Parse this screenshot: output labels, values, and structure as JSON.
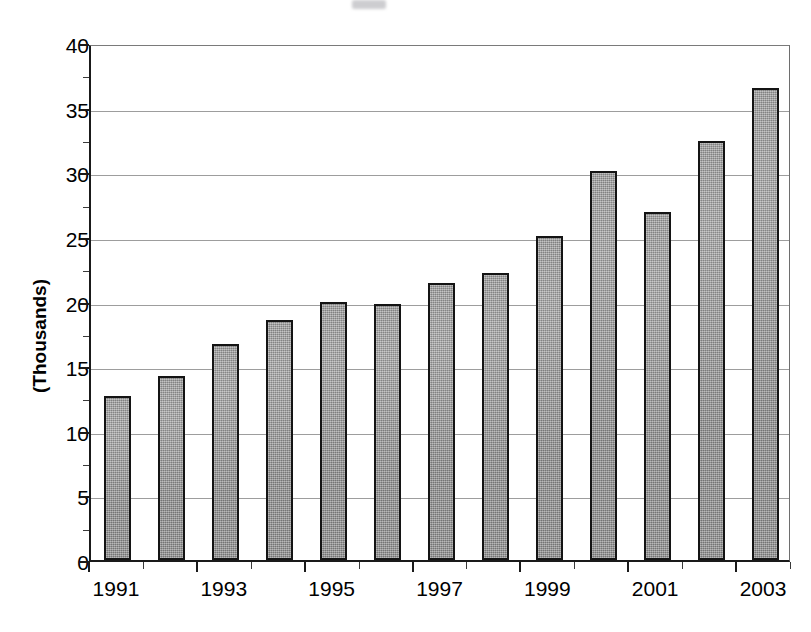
{
  "chart_data": {
    "type": "bar",
    "title": "",
    "xlabel": "",
    "ylabel": "(Thousands)",
    "categories": [
      "1991",
      "1992",
      "1993",
      "1994",
      "1995",
      "1996",
      "1997",
      "1998",
      "1999",
      "2000",
      "2001",
      "2002",
      "2003"
    ],
    "values": [
      12.7,
      14.2,
      16.7,
      18.6,
      20.0,
      19.8,
      21.4,
      22.2,
      25.1,
      30.1,
      26.9,
      32.4,
      36.5
    ],
    "ylim": [
      0,
      40
    ],
    "ytick_step": 5,
    "yticks": [
      0,
      5,
      10,
      15,
      20,
      25,
      30,
      35,
      40
    ],
    "ytick_labels": [
      "0",
      "5",
      "10",
      "15",
      "20",
      "25",
      "30",
      "35",
      "40"
    ],
    "xtick_labels_shown": [
      "1991",
      "1993",
      "1995",
      "1997",
      "1999",
      "2001",
      "2003"
    ],
    "xtick_label_interval": 2,
    "grid": "horizontal",
    "legend": "none",
    "bar_fill_color": "#9b9b9b",
    "bar_edge_color": "#141414",
    "gridline_color": "#9d9d9d",
    "axis_color": "#1a1a1a",
    "background_color": "#ffffff"
  }
}
